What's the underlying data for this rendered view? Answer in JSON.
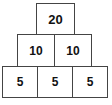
{
  "diagram": {
    "type": "number-pyramid",
    "orientation": "apex-top",
    "colors": {
      "background": "#ffffff",
      "cell_fill": "#ffffff",
      "cell_border": "#444444",
      "text": "#111111"
    },
    "rows": [
      {
        "row_index": 0,
        "cells": [
          {
            "value": "20"
          }
        ]
      },
      {
        "row_index": 1,
        "cells": [
          {
            "value": "10"
          },
          {
            "value": "10"
          }
        ]
      },
      {
        "row_index": 2,
        "cells": [
          {
            "value": "5"
          },
          {
            "value": "5"
          },
          {
            "value": "5"
          }
        ]
      }
    ]
  }
}
